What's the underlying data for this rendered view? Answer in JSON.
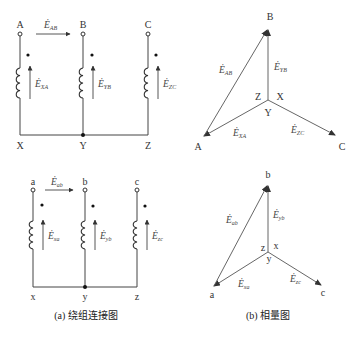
{
  "left_upper": {
    "terminals": [
      "A",
      "B",
      "C"
    ],
    "neutral_labels": [
      "X",
      "Y",
      "Z"
    ],
    "line_emf": {
      "base": "Ė",
      "sub": "AB"
    },
    "phase_emfs": [
      {
        "base": "Ė",
        "sub": "XA"
      },
      {
        "base": "Ė",
        "sub": "YB"
      },
      {
        "base": "Ė",
        "sub": "ZC"
      }
    ]
  },
  "left_lower": {
    "terminals": [
      "a",
      "b",
      "c"
    ],
    "neutral_labels": [
      "x",
      "y",
      "z"
    ],
    "line_emf": {
      "base": "Ė",
      "sub": "ab"
    },
    "phase_emfs": [
      {
        "base": "Ė",
        "sub": "xa"
      },
      {
        "base": "Ė",
        "sub": "yb"
      },
      {
        "base": "Ė",
        "sub": "zc"
      }
    ]
  },
  "right_upper": {
    "vertices": {
      "top": "B",
      "left": "A",
      "right": "C"
    },
    "center_labels": {
      "left": "Z",
      "right": "X",
      "below": "Y"
    },
    "emfs": {
      "line": {
        "base": "Ė",
        "sub": "AB"
      },
      "vertical": {
        "base": "Ė",
        "sub": "YB"
      },
      "left": {
        "base": "Ė",
        "sub": "XA"
      },
      "right": {
        "base": "Ė",
        "sub": "ZC"
      }
    }
  },
  "right_lower": {
    "vertices": {
      "top": "b",
      "left": "a",
      "right": "c"
    },
    "center_labels": {
      "left": "z",
      "right": "x",
      "below": "y"
    },
    "emfs": {
      "line": {
        "base": "Ė",
        "sub": "ab"
      },
      "vertical": {
        "base": "Ė",
        "sub": "yb"
      },
      "left": {
        "base": "Ė",
        "sub": "xa"
      },
      "right": {
        "base": "Ė",
        "sub": "zc"
      }
    }
  },
  "captions": {
    "left": "(a) 绕组连接图",
    "right": "(b) 相量图"
  }
}
